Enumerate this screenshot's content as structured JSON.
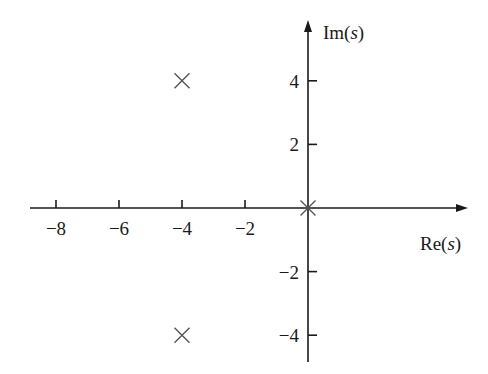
{
  "chart_data": {
    "type": "scatter",
    "title": "",
    "xlabel": "Re(s)",
    "ylabel": "Im(s)",
    "x_ticks": [
      -8,
      -6,
      -4,
      -2
    ],
    "y_ticks": [
      4,
      2,
      -2,
      -4
    ],
    "x_tick_labels": [
      "−8",
      "−6",
      "−4",
      "−2"
    ],
    "y_tick_labels": [
      "4",
      "2",
      "−2",
      "−4"
    ],
    "xlim": [
      -9,
      5
    ],
    "ylim": [
      -5,
      6
    ],
    "grid": false,
    "series": [
      {
        "name": "poles",
        "marker": "x",
        "points": [
          {
            "x": -4,
            "y": 4
          },
          {
            "x": -4,
            "y": -4
          },
          {
            "x": 0,
            "y": 0
          }
        ]
      }
    ]
  },
  "axes": {
    "x_label_main": "Re",
    "x_label_arg": "s",
    "y_label_main": "Im",
    "y_label_arg": "s"
  }
}
